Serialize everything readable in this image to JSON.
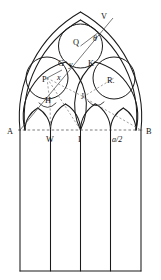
{
  "figure": {
    "background_color": "#ffffff",
    "stroke_color": "#1a1a1a",
    "dashed_color": "#4d4d4d"
  },
  "labels": {
    "apex_point": "V",
    "left_base": "A",
    "right_base": "B",
    "left_circle_center": "P",
    "top_circle_center": "Q",
    "right_circle_center": "R.",
    "tangent_left": "G",
    "tangent_right": "K",
    "cusp_left": "H",
    "cusp_right": "J",
    "mullion_left": "W",
    "mullion_center": "I",
    "var_x": "x",
    "var_y": "y",
    "var_theta": "θ",
    "half_span": "a/2"
  },
  "geometry": {
    "span_left_x": 20,
    "span_right_x": 141,
    "springline_y": 130,
    "apex_x": 80.5,
    "apex_y": 12,
    "sill_y": 271,
    "mullion_xs": [
      50.5,
      80.5,
      110.5
    ],
    "circle_left": {
      "cx": 47,
      "cy": 78,
      "r": 21
    },
    "circle_top": {
      "cx": 80.5,
      "cy": 46,
      "r": 22
    },
    "circle_right": {
      "cx": 114,
      "cy": 78,
      "r": 21
    }
  }
}
